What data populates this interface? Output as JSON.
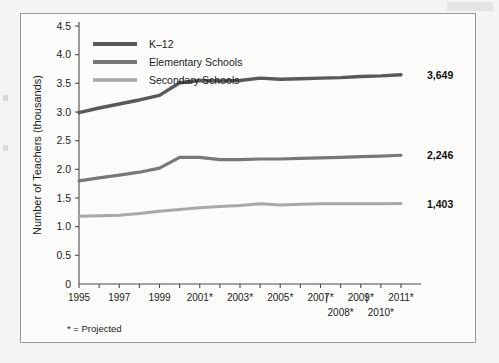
{
  "figure": {
    "footnote": "* = Projected",
    "border_color": "#9a9a98",
    "background": "#fbfbfa"
  },
  "chart_data": {
    "type": "line",
    "title": "",
    "subtitle": "",
    "xlabel": "",
    "ylabel": "Number of Teachers (thousands)",
    "ylim": [
      0,
      4.5
    ],
    "xlim": [
      1995,
      2011
    ],
    "grid": false,
    "legend_position": "top-left",
    "y_ticks": [
      "0",
      "0.5",
      "1.0",
      "1.5",
      "2.0",
      "2.5",
      "3.0",
      "3.5",
      "4.0",
      "4.5"
    ],
    "y_tick_values": [
      0,
      0.5,
      1.0,
      1.5,
      2.0,
      2.5,
      3.0,
      3.5,
      4.0,
      4.5
    ],
    "x_tick_values": [
      1995,
      1996,
      1997,
      1998,
      1999,
      2000,
      2001,
      2002,
      2003,
      2004,
      2005,
      2006,
      2007,
      2008,
      2009,
      2010,
      2011
    ],
    "x_labels_row1": [
      "1995",
      "1997",
      "1999",
      "2001*",
      "2003*",
      "2005*",
      "2007*",
      "2009*",
      "2011*"
    ],
    "x_labels_row1_values": [
      1995,
      1997,
      1999,
      2001,
      2003,
      2005,
      2007,
      2009,
      2011
    ],
    "x_labels_row2": [
      "2008*",
      "2010*"
    ],
    "x_labels_row2_values": [
      2008,
      2010
    ],
    "x_label_separators": [
      2008,
      2010
    ],
    "x": [
      1995,
      1996,
      1997,
      1998,
      1999,
      2000,
      2001,
      2002,
      2003,
      2004,
      2005,
      2006,
      2007,
      2008,
      2009,
      2010,
      2011
    ],
    "series": [
      {
        "name": "K–12",
        "color": "#595959",
        "end_label": "3,649",
        "values": [
          2.99,
          3.07,
          3.14,
          3.21,
          3.29,
          3.51,
          3.55,
          3.54,
          3.55,
          3.59,
          3.57,
          3.58,
          3.59,
          3.6,
          3.62,
          3.63,
          3.649
        ]
      },
      {
        "name": "Elementary Schools",
        "color": "#787878",
        "end_label": "2,246",
        "values": [
          1.8,
          1.85,
          1.9,
          1.95,
          2.02,
          2.21,
          2.21,
          2.17,
          2.17,
          2.18,
          2.18,
          2.19,
          2.2,
          2.21,
          2.22,
          2.23,
          2.246
        ]
      },
      {
        "name": "Secondary Schools",
        "color": "#a8a8a8",
        "end_label": "1,403",
        "values": [
          1.18,
          1.19,
          1.2,
          1.23,
          1.27,
          1.3,
          1.33,
          1.35,
          1.37,
          1.4,
          1.38,
          1.39,
          1.4,
          1.4,
          1.4,
          1.4,
          1.403
        ]
      }
    ]
  }
}
